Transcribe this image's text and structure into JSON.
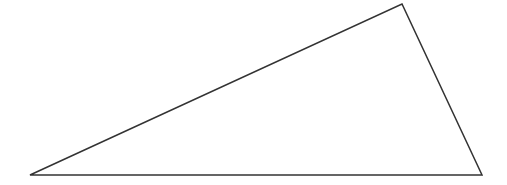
{
  "diagram": {
    "type": "triangle",
    "stroke_color": "#333333",
    "fill_color": "#ffffff",
    "stroke_width": 1.5,
    "vertices": {
      "bottom_left": [
        30,
        175
      ],
      "top": [
        402,
        4
      ],
      "bottom_right": [
        482,
        175
      ]
    }
  }
}
